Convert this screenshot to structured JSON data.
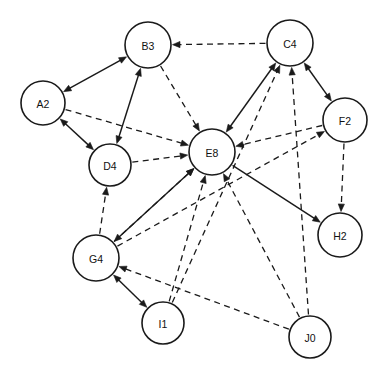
{
  "diagram": {
    "type": "node-link-diagram",
    "canvas": {
      "width": 386,
      "height": 378,
      "background": "#ffffff"
    },
    "style": {
      "node_fill": "#ffffff",
      "node_stroke": "#1a1a1a",
      "edge_color": "#1a1a1a",
      "node_radius": 22,
      "label_font_size": 10.5
    },
    "nodes": [
      {
        "id": "A2",
        "label": "A2",
        "x": 43,
        "y": 103,
        "r": 22
      },
      {
        "id": "B3",
        "label": "B3",
        "x": 148,
        "y": 45,
        "r": 23
      },
      {
        "id": "C4",
        "label": "C4",
        "x": 290,
        "y": 43,
        "r": 23
      },
      {
        "id": "D4",
        "label": "D4",
        "x": 110,
        "y": 165,
        "r": 21
      },
      {
        "id": "E8",
        "label": "E8",
        "x": 212,
        "y": 152,
        "r": 23
      },
      {
        "id": "F2",
        "label": "F2",
        "x": 345,
        "y": 120,
        "r": 22
      },
      {
        "id": "G4",
        "label": "G4",
        "x": 96,
        "y": 258,
        "r": 23
      },
      {
        "id": "H2",
        "label": "H2",
        "x": 340,
        "y": 235,
        "r": 22
      },
      {
        "id": "I1",
        "label": "I1",
        "x": 163,
        "y": 323,
        "r": 21
      },
      {
        "id": "J0",
        "label": "J0",
        "x": 310,
        "y": 337,
        "r": 21
      }
    ],
    "edges": [
      {
        "from": "A2",
        "to": "B3",
        "style": "solid",
        "arrow": "both"
      },
      {
        "from": "A2",
        "to": "D4",
        "style": "solid",
        "arrow": "both"
      },
      {
        "from": "A2",
        "to": "E8",
        "style": "dashed",
        "arrow": "forward"
      },
      {
        "from": "B3",
        "to": "D4",
        "style": "solid",
        "arrow": "both"
      },
      {
        "from": "B3",
        "to": "E8",
        "style": "dashed",
        "arrow": "forward"
      },
      {
        "from": "C4",
        "to": "B3",
        "style": "dashed",
        "arrow": "forward"
      },
      {
        "from": "C4",
        "to": "E8",
        "style": "solid",
        "arrow": "both"
      },
      {
        "from": "C4",
        "to": "F2",
        "style": "solid",
        "arrow": "both"
      },
      {
        "from": "D4",
        "to": "E8",
        "style": "dashed",
        "arrow": "forward"
      },
      {
        "from": "E8",
        "to": "G4",
        "style": "solid",
        "arrow": "both"
      },
      {
        "from": "E8",
        "to": "H2",
        "style": "solid",
        "arrow": "forward"
      },
      {
        "from": "F2",
        "to": "E8",
        "style": "dashed",
        "arrow": "forward"
      },
      {
        "from": "F2",
        "to": "H2",
        "style": "dashed",
        "arrow": "forward"
      },
      {
        "from": "G4",
        "to": "D4",
        "style": "dashed",
        "arrow": "forward"
      },
      {
        "from": "G4",
        "to": "E8",
        "style": "dashed",
        "arrow": "forward"
      },
      {
        "from": "G4",
        "to": "F2",
        "style": "dashed",
        "arrow": "forward"
      },
      {
        "from": "G4",
        "to": "I1",
        "style": "solid",
        "arrow": "both"
      },
      {
        "from": "I1",
        "to": "C4",
        "style": "dashed",
        "arrow": "forward"
      },
      {
        "from": "I1",
        "to": "E8",
        "style": "dashed",
        "arrow": "forward"
      },
      {
        "from": "J0",
        "to": "C4",
        "style": "dashed",
        "arrow": "forward"
      },
      {
        "from": "J0",
        "to": "E8",
        "style": "dashed",
        "arrow": "forward"
      },
      {
        "from": "J0",
        "to": "G4",
        "style": "dashed",
        "arrow": "forward"
      }
    ]
  }
}
